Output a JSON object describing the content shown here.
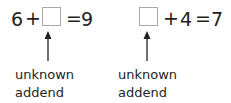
{
  "equations": [
    {
      "left_operand": "6",
      "plus": "+",
      "right_operand": "",
      "equals": "=",
      "result": "9",
      "unknown_position": "right",
      "label_line1": "unknown",
      "label_line2": "addend"
    },
    {
      "left_operand": "",
      "plus": "+",
      "right_operand": "4",
      "equals": "=",
      "result": "7",
      "unknown_position": "left",
      "label_line1": "unknown",
      "label_line2": "addend"
    }
  ],
  "colors": {
    "text": "#231f20",
    "box_border": "#a7a9ac",
    "arrow": "#231f20"
  }
}
